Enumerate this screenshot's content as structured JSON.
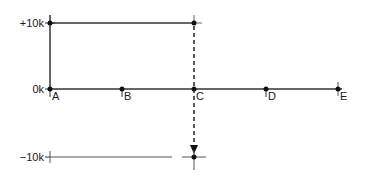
{
  "diagram": {
    "y_levels": [
      {
        "label": "+10k",
        "y": 23
      },
      {
        "label": "0k",
        "y": 89
      },
      {
        "label": "−10k",
        "y": 157
      }
    ],
    "points": [
      {
        "label": "A",
        "x": 50
      },
      {
        "label": "B",
        "x": 122
      },
      {
        "label": "C",
        "x": 194
      },
      {
        "label": "D",
        "x": 266
      },
      {
        "label": "E",
        "x": 338
      }
    ],
    "line_color": "#333333",
    "arrow": {
      "from": "C +10k",
      "to": "C −10k",
      "style": "dashed"
    }
  }
}
